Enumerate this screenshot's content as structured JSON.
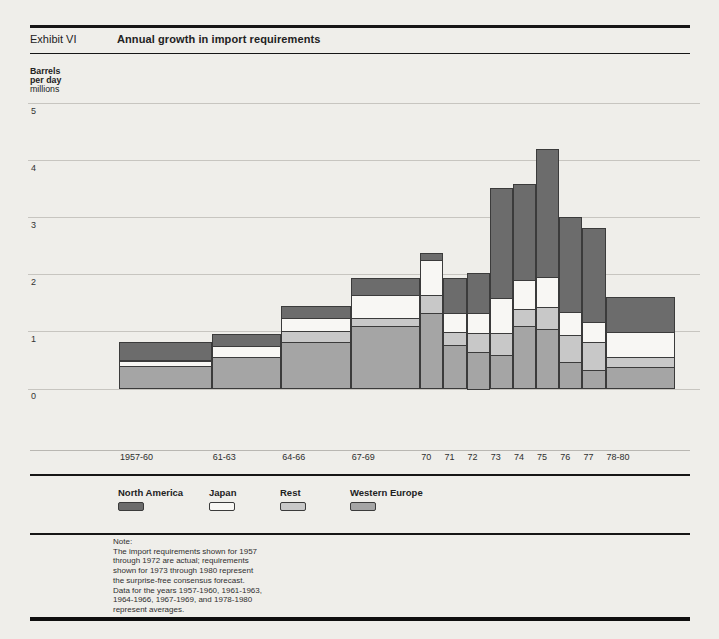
{
  "header": {
    "exhibit_label": "Exhibit VI",
    "title": "Annual growth in import requirements"
  },
  "colors": {
    "north_america": "#6c6c6c",
    "japan": "#f8f7f4",
    "rest": "#c8c8c8",
    "western_europe": "#a5a5a5",
    "bar_border": "#3b3b3b",
    "gridline": "#c7c5c0",
    "background": "#efeeea"
  },
  "chart_data": {
    "type": "bar",
    "stacked": true,
    "title": "Annual growth in import requirements",
    "ylabel_lines": [
      "Barrels",
      "per day",
      "millions"
    ],
    "ylim": [
      0,
      5
    ],
    "y_ticks": [
      0,
      1,
      2,
      3,
      4,
      5
    ],
    "grid": "horizontal",
    "legend_position": "below",
    "categories": [
      "1957-60",
      "61-63",
      "64-66",
      "67-69",
      "70",
      "71",
      "72",
      "73",
      "74",
      "75",
      "76",
      "77",
      "78-80"
    ],
    "category_year_spans": [
      4,
      3,
      3,
      3,
      1,
      1,
      1,
      1,
      1,
      1,
      1,
      1,
      3
    ],
    "stack_order_bottom_to_top": [
      "Western Europe",
      "Rest",
      "Japan",
      "North America"
    ],
    "series": [
      {
        "name": "Western Europe",
        "color_key": "western_europe",
        "values": [
          0.4,
          0.55,
          0.82,
          1.09,
          1.32,
          0.76,
          0.64,
          0.59,
          1.09,
          1.04,
          0.47,
          0.33,
          0.38
        ]
      },
      {
        "name": "Rest",
        "color_key": "rest",
        "values": [
          0.0,
          0.0,
          0.19,
          0.14,
          0.32,
          0.23,
          0.33,
          0.38,
          0.31,
          0.39,
          0.47,
          0.49,
          0.18
        ]
      },
      {
        "name": "Japan",
        "color_key": "japan",
        "values": [
          0.09,
          0.2,
          0.23,
          0.41,
          0.61,
          0.33,
          0.35,
          0.61,
          0.5,
          0.53,
          0.4,
          0.35,
          0.43
        ]
      },
      {
        "name": "North America",
        "color_key": "north_america",
        "values": [
          0.33,
          0.2,
          0.2,
          0.3,
          0.12,
          0.61,
          0.71,
          1.93,
          1.69,
          2.23,
          1.66,
          1.64,
          0.62
        ]
      }
    ],
    "totals": [
      0.82,
      0.95,
      1.44,
      1.94,
      2.37,
      1.93,
      2.03,
      3.51,
      3.59,
      4.19,
      3.0,
      2.81,
      1.61
    ]
  },
  "legend": {
    "items": [
      {
        "label": "North America",
        "color_key": "north_america"
      },
      {
        "label": "Japan",
        "color_key": "japan"
      },
      {
        "label": "Rest",
        "color_key": "rest"
      },
      {
        "label": "Western Europe",
        "color_key": "western_europe"
      }
    ]
  },
  "note": {
    "lines": [
      "Note:",
      "The import requirements shown for 1957",
      "through 1972 are actual; requirements",
      "shown for 1973 through 1980 represent",
      "the surprise-free consensus forecast.",
      "Data for the years 1957-1960, 1961-1963,",
      "1964-1966, 1967-1969, and 1978-1980",
      "represent averages."
    ]
  }
}
